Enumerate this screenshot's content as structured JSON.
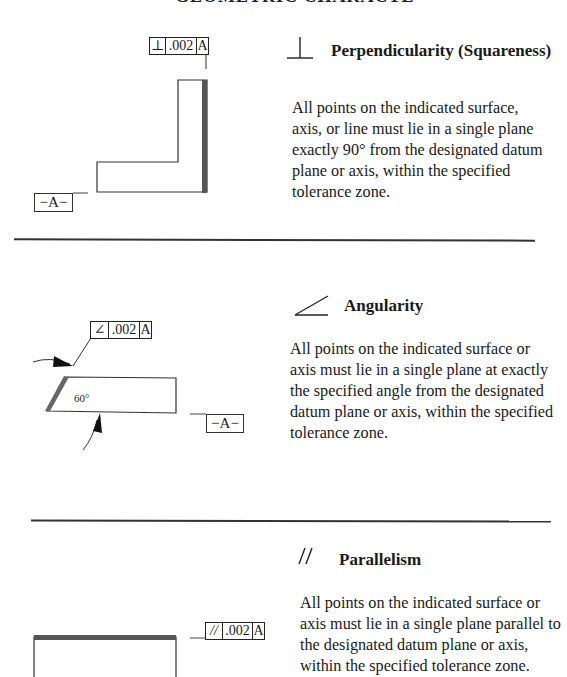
{
  "page": {
    "clipped_title": "GEOMETRIC CHARACTERISTICS"
  },
  "sections": [
    {
      "symbol_name": "perpendicularity",
      "heading": "Perpendicularity (Squareness)",
      "body": "All points on the indicated surface, axis, or line must lie in a single plane exactly 90° from the designated datum plane or axis, within the specified tolerance zone.",
      "fcf": {
        "symbol": "⊥",
        "tolerance": ".002",
        "datum": "A"
      },
      "datum_label": "−A−"
    },
    {
      "symbol_name": "angularity",
      "heading": "Angularity",
      "body": "All points on the indicated surface or axis must lie in a single plane at exactly the specified angle from the designated datum plane or axis, within the specified tolerance zone.",
      "fcf": {
        "symbol": "∠",
        "tolerance": ".002",
        "datum": "A"
      },
      "datum_label": "−A−",
      "angle_label": "60°"
    },
    {
      "symbol_name": "parallelism",
      "heading": "Parallelism",
      "body": "All points on the indicated surface or axis must lie in a single plane parallel to the designated datum plane or axis, within the specified tolerance zone.",
      "fcf": {
        "symbol": "//",
        "tolerance": ".002",
        "datum": "A"
      }
    }
  ],
  "colors": {
    "ink": "#1a1a1a",
    "tolerance_band": "#555555"
  }
}
